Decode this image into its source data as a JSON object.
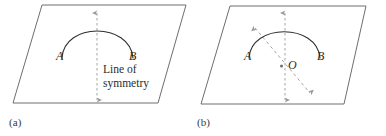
{
  "figure": {
    "type": "geometry-diagram",
    "colors": {
      "plane_outline": "#6e6e6e",
      "arc": "#2f2f2f",
      "dashed_axis": "#9a9a9a",
      "label_text": "#2c2c2c",
      "caption_text": "#3b3b3b",
      "background": "#ffffff"
    }
  },
  "panels": [
    {
      "caption": "(a)",
      "plane": {
        "name": "parallelogram-plane",
        "points": "42,5 186,5 158,103 13,103"
      },
      "arc": {
        "name": "symmetric-arc",
        "start": "62,58",
        "end": "133,58",
        "apex": "97,17"
      },
      "axes": [
        {
          "name": "vertical-symmetry-axis",
          "x1": 97,
          "y1": 12,
          "x2": 97,
          "y2": 101,
          "arrow_start": true,
          "arrow_end": true
        }
      ],
      "labels": [
        {
          "name": "point-label-a",
          "text": "A"
        },
        {
          "name": "point-label-b",
          "text": "B"
        }
      ],
      "annotation": {
        "name": "line-of-symmetry-annotation",
        "line1": "Line of",
        "line2": "symmetry"
      }
    },
    {
      "caption": "(b)",
      "plane": {
        "name": "parallelogram-plane",
        "points": "230,6 366,6 344,104 201,104"
      },
      "arc": {
        "name": "symmetric-arc",
        "start": "249,58",
        "end": "320,58",
        "apex": "285,18"
      },
      "axes": [
        {
          "name": "vertical-symmetry-axis",
          "x1": 285,
          "y1": 12,
          "x2": 285,
          "y2": 101,
          "arrow_start": true,
          "arrow_end": true
        },
        {
          "name": "diagonal-symmetry-axis",
          "x1": 254,
          "y1": 27,
          "x2": 311,
          "y2": 94,
          "arrow_start": true,
          "arrow_end": true
        }
      ],
      "center_point": {
        "name": "center-point-o",
        "cx": 281,
        "cy": 66,
        "label": "O"
      },
      "labels": [
        {
          "name": "point-label-a",
          "text": "A"
        },
        {
          "name": "point-label-b",
          "text": "B"
        }
      ]
    }
  ]
}
